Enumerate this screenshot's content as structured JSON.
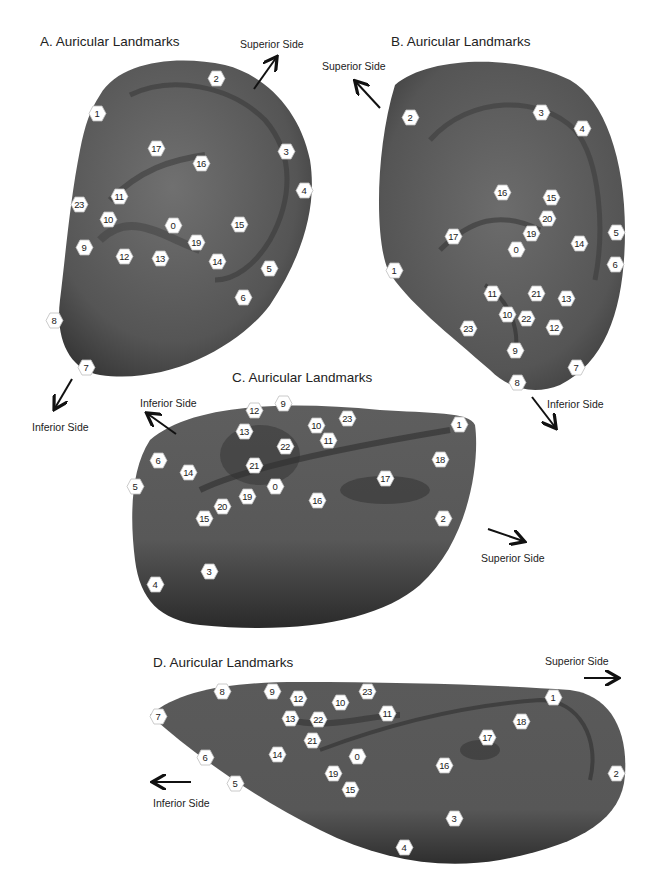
{
  "colors": {
    "ear_dark": "#2f2f2f",
    "ear_mid": "#555555",
    "ear_light": "#6a6a6a",
    "marker_fill": "#ffffff",
    "text": "#222222"
  },
  "panels": [
    {
      "id": "A",
      "title": "A.  Auricular Landmarks",
      "labels": [
        {
          "text": "Superior Side",
          "x": 240,
          "y": 10
        },
        {
          "text": "Inferior Side",
          "x": 32,
          "y": 421
        }
      ],
      "landmarks": [
        {
          "n": "0",
          "x": 173,
          "y": 225
        },
        {
          "n": "1",
          "x": 97,
          "y": 113
        },
        {
          "n": "2",
          "x": 216,
          "y": 78
        },
        {
          "n": "3",
          "x": 286,
          "y": 151
        },
        {
          "n": "4",
          "x": 304,
          "y": 190
        },
        {
          "n": "5",
          "x": 269,
          "y": 268
        },
        {
          "n": "6",
          "x": 243,
          "y": 297
        },
        {
          "n": "7",
          "x": 86,
          "y": 367
        },
        {
          "n": "8",
          "x": 54,
          "y": 320
        },
        {
          "n": "9",
          "x": 84,
          "y": 247
        },
        {
          "n": "10",
          "x": 108,
          "y": 219
        },
        {
          "n": "11",
          "x": 119,
          "y": 196
        },
        {
          "n": "12",
          "x": 124,
          "y": 256
        },
        {
          "n": "13",
          "x": 160,
          "y": 258
        },
        {
          "n": "14",
          "x": 217,
          "y": 261
        },
        {
          "n": "15",
          "x": 239,
          "y": 224
        },
        {
          "n": "16",
          "x": 201,
          "y": 163
        },
        {
          "n": "17",
          "x": 156,
          "y": 148
        },
        {
          "n": "19",
          "x": 196,
          "y": 242
        },
        {
          "n": "23",
          "x": 79,
          "y": 204
        }
      ]
    },
    {
      "id": "B",
      "title": "B.  Auricular Landmarks",
      "labels": [
        {
          "text": "Superior Side",
          "x": 322,
          "y": 58
        },
        {
          "text": "Inferior Side",
          "x": 547,
          "y": 398
        }
      ],
      "landmarks": [
        {
          "n": "0",
          "x": 516,
          "y": 249
        },
        {
          "n": "1",
          "x": 394,
          "y": 270
        },
        {
          "n": "2",
          "x": 410,
          "y": 117
        },
        {
          "n": "3",
          "x": 541,
          "y": 112
        },
        {
          "n": "4",
          "x": 582,
          "y": 128
        },
        {
          "n": "5",
          "x": 616,
          "y": 232
        },
        {
          "n": "6",
          "x": 615,
          "y": 264
        },
        {
          "n": "7",
          "x": 576,
          "y": 367
        },
        {
          "n": "8",
          "x": 517,
          "y": 382
        },
        {
          "n": "9",
          "x": 515,
          "y": 350
        },
        {
          "n": "10",
          "x": 507,
          "y": 314
        },
        {
          "n": "11",
          "x": 492,
          "y": 293
        },
        {
          "n": "12",
          "x": 554,
          "y": 327
        },
        {
          "n": "13",
          "x": 566,
          "y": 298
        },
        {
          "n": "14",
          "x": 579,
          "y": 243
        },
        {
          "n": "15",
          "x": 551,
          "y": 197
        },
        {
          "n": "16",
          "x": 502,
          "y": 192
        },
        {
          "n": "17",
          "x": 453,
          "y": 236
        },
        {
          "n": "19",
          "x": 531,
          "y": 233
        },
        {
          "n": "20",
          "x": 547,
          "y": 218
        },
        {
          "n": "21",
          "x": 536,
          "y": 293
        },
        {
          "n": "22",
          "x": 526,
          "y": 318
        },
        {
          "n": "23",
          "x": 468,
          "y": 328
        }
      ]
    },
    {
      "id": "C",
      "title": "C.  Auricular Landmarks",
      "labels": [
        {
          "text": "Inferior Side",
          "x": 140,
          "y": 397
        },
        {
          "text": "Superior Side",
          "x": 481,
          "y": 552
        }
      ],
      "landmarks": [
        {
          "n": "0",
          "x": 275,
          "y": 486
        },
        {
          "n": "1",
          "x": 459,
          "y": 424
        },
        {
          "n": "2",
          "x": 443,
          "y": 518
        },
        {
          "n": "3",
          "x": 209,
          "y": 571
        },
        {
          "n": "4",
          "x": 155,
          "y": 584
        },
        {
          "n": "5",
          "x": 135,
          "y": 486
        },
        {
          "n": "6",
          "x": 158,
          "y": 460
        },
        {
          "n": "9",
          "x": 283,
          "y": 403
        },
        {
          "n": "10",
          "x": 316,
          "y": 425
        },
        {
          "n": "11",
          "x": 328,
          "y": 440
        },
        {
          "n": "12",
          "x": 254,
          "y": 410
        },
        {
          "n": "13",
          "x": 244,
          "y": 431
        },
        {
          "n": "14",
          "x": 188,
          "y": 472
        },
        {
          "n": "15",
          "x": 204,
          "y": 518
        },
        {
          "n": "16",
          "x": 317,
          "y": 500
        },
        {
          "n": "17",
          "x": 385,
          "y": 478
        },
        {
          "n": "18",
          "x": 440,
          "y": 459
        },
        {
          "n": "19",
          "x": 247,
          "y": 496
        },
        {
          "n": "20",
          "x": 222,
          "y": 506
        },
        {
          "n": "21",
          "x": 254,
          "y": 465
        },
        {
          "n": "22",
          "x": 285,
          "y": 446
        },
        {
          "n": "23",
          "x": 347,
          "y": 418
        }
      ]
    },
    {
      "id": "D",
      "title": "D.  Auricular Landmarks",
      "labels": [
        {
          "text": "Superior Side",
          "x": 545,
          "y": 655
        },
        {
          "text": "Inferior Side",
          "x": 153,
          "y": 798
        }
      ],
      "landmarks": [
        {
          "n": "0",
          "x": 357,
          "y": 756
        },
        {
          "n": "1",
          "x": 553,
          "y": 697
        },
        {
          "n": "2",
          "x": 616,
          "y": 773
        },
        {
          "n": "3",
          "x": 454,
          "y": 818
        },
        {
          "n": "4",
          "x": 404,
          "y": 847
        },
        {
          "n": "5",
          "x": 235,
          "y": 783
        },
        {
          "n": "6",
          "x": 205,
          "y": 757
        },
        {
          "n": "7",
          "x": 158,
          "y": 716
        },
        {
          "n": "8",
          "x": 222,
          "y": 691
        },
        {
          "n": "9",
          "x": 272,
          "y": 691
        },
        {
          "n": "10",
          "x": 340,
          "y": 702
        },
        {
          "n": "11",
          "x": 387,
          "y": 713
        },
        {
          "n": "12",
          "x": 298,
          "y": 698
        },
        {
          "n": "13",
          "x": 290,
          "y": 718
        },
        {
          "n": "14",
          "x": 277,
          "y": 754
        },
        {
          "n": "15",
          "x": 350,
          "y": 789
        },
        {
          "n": "16",
          "x": 444,
          "y": 765
        },
        {
          "n": "17",
          "x": 487,
          "y": 737
        },
        {
          "n": "18",
          "x": 521,
          "y": 721
        },
        {
          "n": "19",
          "x": 333,
          "y": 773
        },
        {
          "n": "21",
          "x": 312,
          "y": 740
        },
        {
          "n": "22",
          "x": 318,
          "y": 719
        },
        {
          "n": "23",
          "x": 367,
          "y": 691
        }
      ]
    }
  ]
}
